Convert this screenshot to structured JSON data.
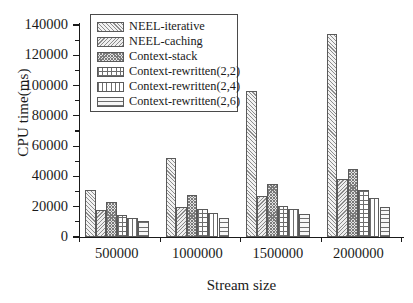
{
  "chart_data": {
    "type": "bar",
    "title": "",
    "xlabel": "Stream size",
    "ylabel": "CPU time(ms)",
    "categories": [
      "500000",
      "1000000",
      "1500000",
      "2000000"
    ],
    "ylim": [
      0,
      140000
    ],
    "yticks": [
      0,
      20000,
      40000,
      60000,
      80000,
      100000,
      120000,
      140000
    ],
    "ytick_labels": [
      "0",
      "20000",
      "40000",
      "60000",
      "80000",
      "100000",
      "120000",
      "140000"
    ],
    "grid": false,
    "legend_position": "upper-left-inside",
    "series": [
      {
        "name": "NEEL-iterative",
        "pattern": "diagonal-hatch-up",
        "values": [
          31000,
          52000,
          96500,
          134000
        ]
      },
      {
        "name": "NEEL-caching",
        "pattern": "diagonal-hatch-down",
        "values": [
          18000,
          20000,
          26800,
          38500
        ]
      },
      {
        "name": "Context-stack",
        "pattern": "dense-crosshatch",
        "values": [
          23000,
          28000,
          35000,
          45000
        ]
      },
      {
        "name": "Context-rewritten(2,2)",
        "pattern": "square-grid",
        "values": [
          14500,
          18300,
          20800,
          31000
        ]
      },
      {
        "name": "Context-rewritten(2,4)",
        "pattern": "vertical-lines",
        "values": [
          12800,
          16000,
          18800,
          25500
        ]
      },
      {
        "name": "Context-rewritten(2,6)",
        "pattern": "horizontal-lines",
        "values": [
          10500,
          12300,
          15200,
          19500
        ]
      }
    ]
  },
  "colors": {
    "axis": "#1a1a1a",
    "bar_outline": "#5a5a5a",
    "hatch": "#7a7a7a",
    "background": "#ffffff"
  }
}
